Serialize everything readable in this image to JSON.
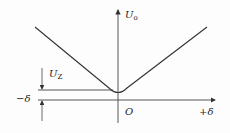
{
  "diagram": {
    "y_axis_label": "U",
    "y_axis_label_sub": "o",
    "x_axis_label_positive": "+δ",
    "x_axis_label_negative": "−δ",
    "origin_label": "O",
    "dimension_label": "U",
    "dimension_label_sub": "Z",
    "curve": "V-shaped characteristic with rounded minimum at origin offset U_Z above axis",
    "line_color": "#333333"
  }
}
